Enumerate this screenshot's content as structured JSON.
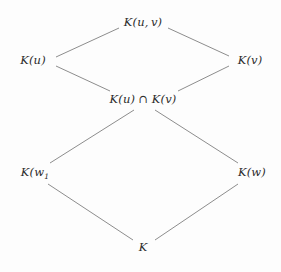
{
  "diagram": {
    "kind": "hasse-lattice-diagram",
    "title": "",
    "background_color": "#fdfdfd",
    "line_color": "#8d8d8d",
    "text_color": "#2b2b2b",
    "nodes": [
      {
        "id": "top",
        "label": "K(u, v)",
        "label_plain": "K(u,v)",
        "x": 143,
        "y": 23
      },
      {
        "id": "ku",
        "label": "K(u)",
        "label_plain": "K(u)",
        "x": 33,
        "y": 61
      },
      {
        "id": "kv",
        "label": "K(v)",
        "label_plain": "K(v)",
        "x": 250,
        "y": 61
      },
      {
        "id": "meet",
        "label": "K(u) ∩ K(v)",
        "label_plain": "K(u) n K(v)",
        "x": 143,
        "y": 100
      },
      {
        "id": "kw1",
        "label": "K(w₁",
        "label_plain": "K(w1",
        "x": 35,
        "y": 173
      },
      {
        "id": "kw",
        "label": "K(w)",
        "label_plain": "K(w)",
        "x": 252,
        "y": 173
      },
      {
        "id": "bottom",
        "label": "K",
        "label_plain": "K",
        "x": 143,
        "y": 248
      }
    ],
    "edges": [
      {
        "id": "edge-ku-top",
        "from": "ku",
        "to": "top",
        "x1": 56,
        "y1": 57,
        "x2": 119,
        "y2": 28
      },
      {
        "id": "edge-top-kv",
        "from": "top",
        "to": "kv",
        "x1": 168,
        "y1": 28,
        "x2": 229,
        "y2": 56
      },
      {
        "id": "edge-ku-meet",
        "from": "ku",
        "to": "meet",
        "x1": 56,
        "y1": 66,
        "x2": 110,
        "y2": 91
      },
      {
        "id": "edge-kv-meet",
        "from": "kv",
        "to": "meet",
        "x1": 229,
        "y1": 66,
        "x2": 178,
        "y2": 91
      },
      {
        "id": "edge-meet-kw1",
        "from": "meet",
        "to": "kw1",
        "x1": 134,
        "y1": 110,
        "x2": 50,
        "y2": 163
      },
      {
        "id": "edge-meet-kw",
        "from": "meet",
        "to": "kw",
        "x1": 155,
        "y1": 110,
        "x2": 238,
        "y2": 163
      },
      {
        "id": "edge-kw1-bottom",
        "from": "kw1",
        "to": "bottom",
        "x1": 48,
        "y1": 184,
        "x2": 133,
        "y2": 240
      },
      {
        "id": "edge-kw-bottom",
        "from": "kw",
        "to": "bottom",
        "x1": 238,
        "y1": 184,
        "x2": 155,
        "y2": 240
      }
    ]
  }
}
